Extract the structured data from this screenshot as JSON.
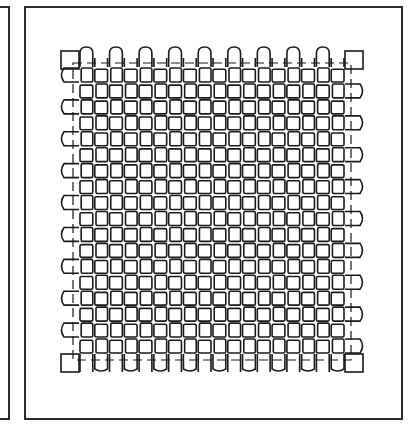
{
  "figure": {
    "frames": [
      {
        "id": "left-partial-panel",
        "x": -20,
        "y": 6,
        "w": 30,
        "h": 414
      },
      {
        "id": "main-panel",
        "x": 24,
        "y": 6,
        "w": 379,
        "h": 414
      }
    ],
    "weave": {
      "x0": 61,
      "y0": 49,
      "x1": 363,
      "y1": 372,
      "cols": 20,
      "rows": 20,
      "margin": 18,
      "guide_inset": 12,
      "stroke_color": "#1a1a1a",
      "stroke_width": 1.6
    }
  }
}
